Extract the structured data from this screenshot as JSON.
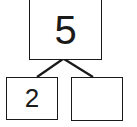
{
  "number_bond": {
    "whole": "5",
    "parts": [
      "2",
      ""
    ]
  },
  "colors": {
    "stroke": "#1a1a1a",
    "background": "#ffffff"
  }
}
